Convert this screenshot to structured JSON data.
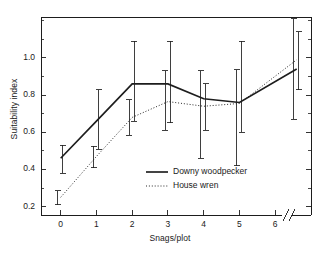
{
  "chart_data": {
    "type": "line",
    "title": "",
    "subtitle": "",
    "xlabel": "Snags/plot",
    "ylabel": "Suitability index",
    "xlim": [
      -0.55,
      7.0
    ],
    "ylim": [
      0.155,
      1.22
    ],
    "grid": false,
    "legend_position": "inside-lower-right",
    "axis_break": {
      "axis": "x",
      "after_tick": 6,
      "symbol": "double-slash"
    },
    "xticks": [
      0,
      1,
      2,
      3,
      4,
      5,
      6
    ],
    "xtick_labels": [
      "0",
      "1",
      "2",
      "3",
      "4",
      "5",
      "6"
    ],
    "yticks": [
      0.2,
      0.4,
      0.6,
      0.8,
      1.0
    ],
    "ytick_labels": [
      "0.2",
      "0.4",
      "0.6",
      "0.8",
      "1.0"
    ],
    "yminorticks": [
      0.3,
      0.5,
      0.7,
      0.9,
      1.1,
      1.2
    ],
    "x": [
      0,
      1,
      2,
      3,
      4,
      5,
      6.6
    ],
    "series": [
      {
        "name": "Downy woodpecker",
        "style": "solid",
        "marker_x_offset": 0.06,
        "values": [
          0.46,
          0.66,
          0.86,
          0.86,
          0.78,
          0.76,
          0.94
        ],
        "err_low": [
          0.38,
          0.51,
          0.66,
          0.65,
          0.61,
          0.6,
          0.83
        ],
        "err_high": [
          0.53,
          0.83,
          1.09,
          1.09,
          0.86,
          1.09,
          1.14
        ]
      },
      {
        "name": "House wren",
        "style": "dotted",
        "marker_x_offset": -0.08,
        "values": [
          0.25,
          0.47,
          0.68,
          0.765,
          0.74,
          0.755,
          0.99
        ],
        "err_low": [
          0.21,
          0.41,
          0.585,
          0.61,
          0.46,
          0.42,
          0.67
        ],
        "err_high": [
          0.285,
          0.525,
          0.775,
          0.93,
          0.93,
          0.935,
          1.21
        ]
      }
    ]
  },
  "legend": {
    "entries": [
      {
        "label": "Downy woodpecker",
        "style": "solid"
      },
      {
        "label": "House wren",
        "style": "dotted"
      }
    ]
  }
}
